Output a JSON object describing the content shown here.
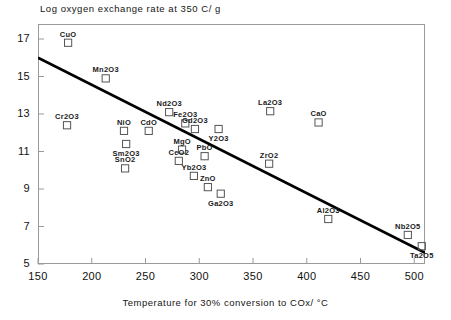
{
  "chart_data": {
    "type": "scatter",
    "title": "Log oxygen exchange rate at 350 C/ g",
    "xlabel": "Temperature for 30% conversion to COx/ °C",
    "ylabel": "",
    "xlim": [
      150,
      510
    ],
    "ylim": [
      5,
      17.8
    ],
    "xticks": [
      150,
      200,
      250,
      300,
      350,
      400,
      450,
      500
    ],
    "yticks": [
      5,
      7,
      9,
      11,
      13,
      15,
      17
    ],
    "grid": false,
    "legend": "none",
    "marker": "open-square",
    "points": [
      {
        "label": "CuO",
        "x": 178,
        "y": 16.8,
        "label_pos": "above"
      },
      {
        "label": "Mn2O3",
        "x": 213,
        "y": 14.9,
        "label_pos": "above"
      },
      {
        "label": "Cr2O3",
        "x": 177,
        "y": 12.4,
        "label_pos": "above"
      },
      {
        "label": "NiO",
        "x": 230,
        "y": 12.1,
        "label_pos": "above"
      },
      {
        "label": "CdO",
        "x": 253,
        "y": 12.1,
        "label_pos": "above"
      },
      {
        "label": "Sm2O3",
        "x": 232,
        "y": 11.4,
        "label_pos": "below"
      },
      {
        "label": "SnO2",
        "x": 231,
        "y": 10.1,
        "label_pos": "above"
      },
      {
        "label": "Nd2O3",
        "x": 272,
        "y": 13.1,
        "label_pos": "above"
      },
      {
        "label": "Fe2O3",
        "x": 287,
        "y": 12.5,
        "label_pos": "above"
      },
      {
        "label": "Gd2O3",
        "x": 296,
        "y": 12.2,
        "label_pos": "above"
      },
      {
        "label": "MgO",
        "x": 284,
        "y": 11.1,
        "label_pos": "above"
      },
      {
        "label": "CeO2",
        "x": 281,
        "y": 10.5,
        "label_pos": "above"
      },
      {
        "label": "PbO",
        "x": 305,
        "y": 10.75,
        "label_pos": "above"
      },
      {
        "label": "Yb2O3",
        "x": 295,
        "y": 9.7,
        "label_pos": "above"
      },
      {
        "label": "ZnO",
        "x": 308,
        "y": 9.1,
        "label_pos": "above"
      },
      {
        "label": "Ga2O3",
        "x": 320,
        "y": 8.75,
        "label_pos": "below"
      },
      {
        "label": "Y2O3",
        "x": 318,
        "y": 12.2,
        "label_pos": "below"
      },
      {
        "label": "La2O3",
        "x": 366,
        "y": 13.15,
        "label_pos": "above"
      },
      {
        "label": "ZrO2",
        "x": 365,
        "y": 10.35,
        "label_pos": "above"
      },
      {
        "label": "CaO",
        "x": 411,
        "y": 12.55,
        "label_pos": "above"
      },
      {
        "label": "Al2O3",
        "x": 420,
        "y": 7.4,
        "label_pos": "above"
      },
      {
        "label": "Nb2O5",
        "x": 494,
        "y": 6.55,
        "label_pos": "above"
      },
      {
        "label": "Ta2O5",
        "x": 507,
        "y": 5.95,
        "label_pos": "below"
      }
    ],
    "trend_line": {
      "name": "linear-fit",
      "x1": 150,
      "y1": 16.0,
      "x2": 510,
      "y2": 5.6,
      "color": "#000000",
      "width": 2.6
    }
  },
  "colors": {
    "frame": "#9a9a9a",
    "text": "#111111",
    "marker_stroke": "#555555",
    "trend": "#000000"
  }
}
